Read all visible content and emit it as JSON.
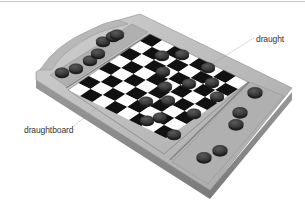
{
  "diagram": {
    "labels": [
      {
        "id": "draught",
        "text": "draught"
      },
      {
        "id": "draughtboard",
        "text": "draughtboard"
      }
    ],
    "board": {
      "rows": 8,
      "cols": 8,
      "light_square": "#ffffff",
      "dark_square": "#111111"
    },
    "colors": {
      "tray_top": "#bdbdbd",
      "tray_side": "#8e8e8e",
      "tray_inner": "#a9a9a9",
      "piece": "#3a3a3a",
      "piece_top": "#555555",
      "leader_line": "#888888",
      "label_text": "#333333"
    },
    "pieces_on_board": 14,
    "pieces_left_tray": 7,
    "pieces_right_tray": 5
  }
}
